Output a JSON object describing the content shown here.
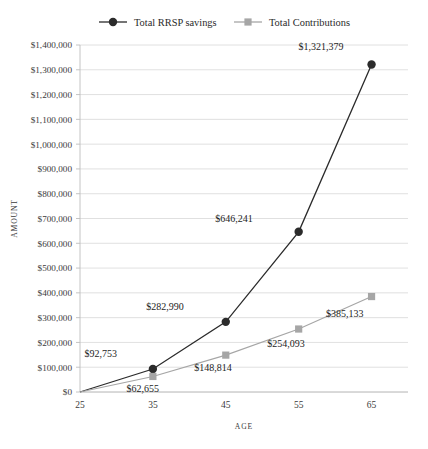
{
  "chart_data": {
    "type": "line",
    "title": "",
    "xlabel": "Age",
    "ylabel": "Amount",
    "x": [
      25,
      35,
      45,
      55,
      65
    ],
    "xtick_labels": [
      "25",
      "35",
      "45",
      "55",
      "65"
    ],
    "ylim": [
      0,
      1400000
    ],
    "ytick_values": [
      0,
      100000,
      200000,
      300000,
      400000,
      500000,
      600000,
      700000,
      800000,
      900000,
      1000000,
      1100000,
      1200000,
      1300000,
      1400000
    ],
    "ytick_labels": [
      "$0",
      "$100,000",
      "$200,000",
      "$300,000",
      "$400,000",
      "$500,000",
      "$600,000",
      "$700,000",
      "$800,000",
      "$900,000",
      "$1,000,000",
      "$1,100,000",
      "$1,200,000",
      "$1,300,000",
      "$1,400,000"
    ],
    "grid": true,
    "legend_position": "top",
    "series": [
      {
        "name": "Total RRSP savings",
        "color": "#2b2b2b",
        "marker": "circle",
        "values": [
          0,
          92753,
          282990,
          646241,
          1321379
        ],
        "point_labels": [
          "",
          "$92,753",
          "$282,990",
          "$646,241",
          "$1,321,379"
        ],
        "label_offsets": [
          {
            "dx": 0,
            "dy": 0
          },
          {
            "dx": -36,
            "dy": -12
          },
          {
            "dx": -42,
            "dy": -12
          },
          {
            "dx": -46,
            "dy": -10
          },
          {
            "dx": -28,
            "dy": -14
          }
        ]
      },
      {
        "name": "Total Contributions",
        "color": "#a6a6a6",
        "marker": "square",
        "values": [
          0,
          62655,
          148814,
          254093,
          385133
        ],
        "point_labels": [
          "",
          "$62,655",
          "$148,814",
          "$254,093",
          "$385,133"
        ],
        "label_offsets": [
          {
            "dx": 0,
            "dy": 0
          },
          {
            "dx": 6,
            "dy": 16
          },
          {
            "dx": 6,
            "dy": 16
          },
          {
            "dx": 6,
            "dy": 18
          },
          {
            "dx": -8,
            "dy": 20
          }
        ]
      }
    ]
  },
  "legend": {
    "items": [
      {
        "label": "Total RRSP savings",
        "color": "#2b2b2b",
        "marker": "circle"
      },
      {
        "label": "Total Contributions",
        "color": "#a6a6a6",
        "marker": "square"
      }
    ]
  },
  "axes": {
    "y_title": "Amount",
    "x_title": "Age"
  }
}
